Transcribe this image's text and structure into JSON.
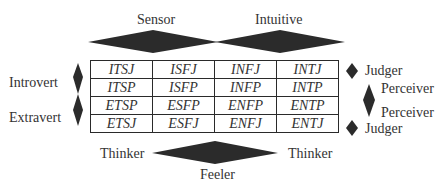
{
  "labels": {
    "sensor": "Sensor",
    "intuitive": "Intuitive",
    "introvert": "Introvert",
    "extravert": "Extravert",
    "judger_top": "Judger",
    "perceiver_top": "Perceiver",
    "perceiver_bottom": "Perceiver",
    "judger_bottom": "Judger",
    "thinker_left": "Thinker",
    "thinker_right": "Thinker",
    "feeler": "Feeler"
  },
  "grid": {
    "rows": [
      [
        "ITSJ",
        "ISFJ",
        "INFJ",
        "INTJ"
      ],
      [
        "ITSP",
        "ISFP",
        "INFP",
        "INTP"
      ],
      [
        "ETSP",
        "ESFP",
        "ENFP",
        "ENTP"
      ],
      [
        "ETSJ",
        "ESFJ",
        "ENFJ",
        "ENTJ"
      ]
    ]
  },
  "colors": {
    "diamond_fill": "#2b2b2b",
    "line": "#2a2a2a"
  }
}
